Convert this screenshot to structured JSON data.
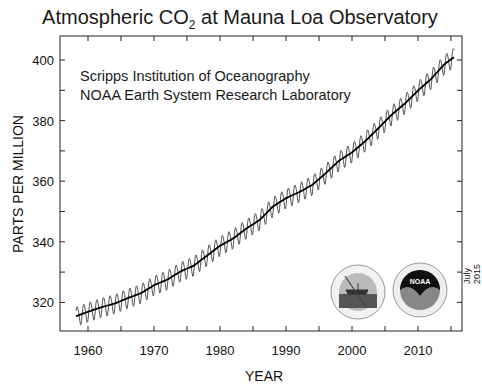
{
  "chart_data": {
    "type": "line",
    "title": "Atmospheric CO2 at Mauna Loa Observatory",
    "title_parts": {
      "pre": "Atmospheric CO",
      "sub": "2",
      "post": " at Mauna Loa Observatory"
    },
    "xlabel": "YEAR",
    "ylabel": "PARTS PER MILLION",
    "xlim": [
      1956.1,
      2017
    ],
    "ylim": [
      310,
      408
    ],
    "x_ticks": [
      1960,
      1970,
      1980,
      1990,
      2000,
      2010
    ],
    "y_ticks": [
      320,
      340,
      360,
      380,
      400
    ],
    "grid": false,
    "annotations": [
      "Scripps Institution of Oceanography",
      "NOAA Earth System Research Laboratory"
    ],
    "date_note": "July 2015",
    "series": [
      {
        "name": "Monthly mean (seasonal cycle)",
        "style": "thin gray oscillating line",
        "seasonal_amplitude_ppm": 3.2
      },
      {
        "name": "Seasonally corrected trend",
        "style": "thick black line",
        "x": [
          1958,
          1960,
          1962,
          1964,
          1966,
          1968,
          1970,
          1972,
          1974,
          1976,
          1978,
          1980,
          1982,
          1984,
          1986,
          1988,
          1990,
          1992,
          1994,
          1996,
          1998,
          2000,
          2002,
          2004,
          2006,
          2008,
          2010,
          2012,
          2014,
          2015.5
        ],
        "values": [
          315.3,
          316.9,
          318.4,
          319.6,
          321.4,
          323.0,
          325.7,
          327.5,
          330.2,
          332.1,
          335.4,
          338.7,
          341.1,
          344.4,
          347.2,
          351.6,
          354.4,
          356.4,
          358.8,
          362.6,
          366.7,
          369.5,
          373.2,
          377.5,
          381.9,
          385.6,
          389.9,
          393.8,
          398.6,
          401.0
        ]
      }
    ]
  },
  "logos": [
    {
      "name": "Scripps Institution of Oceanography seal",
      "text": "UCSD"
    },
    {
      "name": "NOAA seal",
      "text": "NOAA"
    }
  ]
}
